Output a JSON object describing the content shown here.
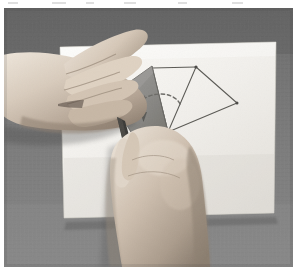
{
  "image": {
    "kind": "photograph",
    "color_mode": "grayscale",
    "width": 300,
    "height": 267,
    "caption": "",
    "subject": "two hands folding a sheet of paper bearing a drawn geometric triangle construction"
  },
  "frame": {
    "page_background": "#ffffff",
    "photo_left": 4,
    "photo_top": 8,
    "photo_width": 289,
    "photo_height": 259
  },
  "scene": {
    "table": {
      "name": "table-surface",
      "description": "dark grey woven fabric tabletop",
      "color": "#7a7a7a",
      "color_dark": "#626262",
      "color_light": "#8f8f8f"
    },
    "paper_sheet": {
      "name": "paper-sheet",
      "description": "large white square sheet of paper lying on the table",
      "color": "#f2f1ee",
      "shadow_color": "#b9b7b2",
      "corners": [
        {
          "label": "top-left",
          "x": 60,
          "y": 47
        },
        {
          "label": "top-right",
          "x": 276,
          "y": 42
        },
        {
          "label": "bottom-right",
          "x": 274,
          "y": 213
        },
        {
          "label": "bottom-left",
          "x": 64,
          "y": 218
        }
      ]
    },
    "folded_flap": {
      "name": "folded-paper-flap",
      "description": "triangular corner of the paper lifted and folded up, shown in shaded grey",
      "fill": "#8d8c8a",
      "edge": "#5d5c5a",
      "vertices": [
        {
          "x": 152,
          "y": 66
        },
        {
          "x": 110,
          "y": 96
        },
        {
          "x": 132,
          "y": 133
        },
        {
          "x": 168,
          "y": 132
        }
      ]
    },
    "drawn_figure": {
      "name": "triangle-construction",
      "description": "pencil-drawn triangles on the paper: an upper triangle joined to a right-hand triangle",
      "line_color": "#5a5954",
      "vertices": [
        {
          "label": "A",
          "x": 152,
          "y": 68
        },
        {
          "label": "B",
          "x": 196,
          "y": 67
        },
        {
          "label": "C",
          "x": 168,
          "y": 132
        },
        {
          "label": "D",
          "x": 237,
          "y": 103
        }
      ],
      "edges": [
        {
          "from": "A",
          "to": "B"
        },
        {
          "from": "A",
          "to": "C"
        },
        {
          "from": "B",
          "to": "C"
        },
        {
          "from": "B",
          "to": "D"
        },
        {
          "from": "C",
          "to": "D"
        }
      ]
    },
    "fold_arrow": {
      "name": "fold-direction-arrow",
      "description": "dashed curved arc with an arrowhead showing the direction the flap folds",
      "color": "#6b6a66",
      "style": "dashed",
      "arc_start": {
        "x": 180,
        "y": 104
      },
      "arc_end": {
        "x": 141,
        "y": 100
      },
      "arrow_tip": {
        "x": 140,
        "y": 116
      }
    },
    "hands": [
      {
        "name": "left-hand",
        "description": "left hand entering from the left edge, fingers pressing down on the paper near the fold",
        "skin_light": "#e2d9cf",
        "skin_mid": "#c2b4a6",
        "skin_shadow": "#8e8073"
      },
      {
        "name": "right-hand",
        "description": "right hand entering from the bottom, thumb and fingers lifting the folded corner",
        "skin_light": "#ded4c8",
        "skin_mid": "#bdae9f",
        "skin_shadow": "#8a7d70"
      }
    ],
    "stylus": {
      "name": "stylus-tool",
      "description": "dark slender pointed tool (pen/stylus) held between the fingers of the lower hand, tip at the fold crease",
      "color": "#3a3936",
      "tip": {
        "x": 118,
        "y": 119
      },
      "tail": {
        "x": 130,
        "y": 160
      }
    }
  }
}
